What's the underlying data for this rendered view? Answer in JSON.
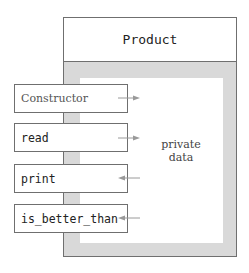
{
  "diagram": {
    "class_name": "Product",
    "private_label": "private data",
    "private_label_lines": [
      "private",
      "data"
    ],
    "methods": [
      {
        "label": "Constructor",
        "style": "serif",
        "arrow_direction": "right"
      },
      {
        "label": "read",
        "style": "mono",
        "arrow_direction": "right"
      },
      {
        "label": "print",
        "style": "mono",
        "arrow_direction": "left"
      },
      {
        "label": "is_better_than",
        "style": "mono",
        "arrow_direction": "left"
      }
    ]
  },
  "colors": {
    "border": "#6f6f6f",
    "shell": "#d9d9d9",
    "background": "#ffffff",
    "arrow": "#9a9a9a"
  }
}
